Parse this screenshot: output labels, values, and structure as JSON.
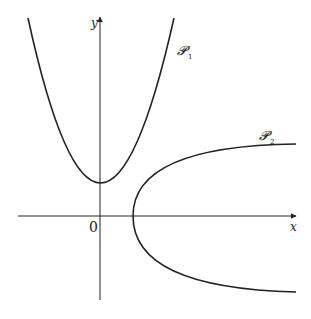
{
  "figure": {
    "axes": {
      "x_label": "x",
      "y_label": "y",
      "origin_label": "0"
    },
    "curves": [
      {
        "id": "P1",
        "label": "𝓟",
        "subscript": "1",
        "description": "upward-opening parabola with vertex on positive y-axis"
      },
      {
        "id": "P2",
        "label": "𝓟",
        "subscript": "2",
        "description": "rightward-opening parabola with vertex on positive x-axis"
      }
    ],
    "colors": {
      "stroke": "#222222",
      "background": "#ffffff"
    }
  }
}
